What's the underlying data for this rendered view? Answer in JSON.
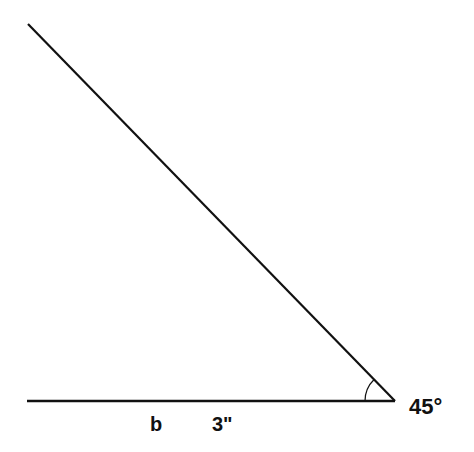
{
  "diagram": {
    "type": "angle",
    "angle_label": "45°",
    "side_label_letter": "b",
    "side_label_length": "3\"",
    "line_color": "#111111",
    "background": "#ffffff",
    "vertex": [
      395,
      401
    ],
    "horizontal_ray_end": [
      27,
      401
    ],
    "diagonal_ray_end": [
      28,
      24
    ]
  }
}
